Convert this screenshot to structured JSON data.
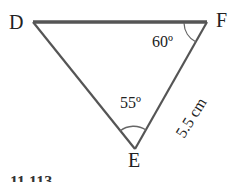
{
  "figure": {
    "vertices": {
      "D": "D",
      "E": "E",
      "F": "F"
    },
    "angles": {
      "F": "60º",
      "E": "55º"
    },
    "side_EF": "5.5 cm",
    "caption": "11.113"
  },
  "colors": {
    "line": "#555555",
    "text": "#222222",
    "background": "#ffffff"
  }
}
